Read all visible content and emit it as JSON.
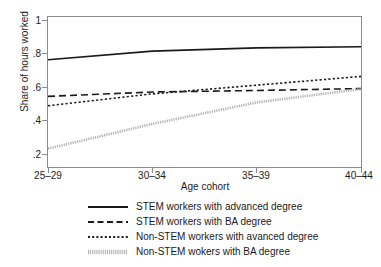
{
  "chart_data": {
    "type": "line",
    "title": "",
    "xlabel": "Age cohort",
    "ylabel": "Share of hours worked",
    "categories": [
      "25–29",
      "30–34",
      "35–39",
      "40–44"
    ],
    "x": [
      0,
      1,
      2,
      3
    ],
    "xlim": [
      0,
      3
    ],
    "ylim": [
      0.2,
      1
    ],
    "yticks": [
      "1",
      ".8",
      ".6",
      ".4",
      ".2"
    ],
    "ytick_values": [
      1,
      0.8,
      0.6,
      0.4,
      0.2
    ],
    "grid": false,
    "legend_position": "below",
    "series": [
      {
        "name": "STEM workers with advanced degree",
        "style": "solid",
        "color": "#1a1a1a",
        "values": [
          0.77,
          0.815,
          0.832,
          0.838
        ]
      },
      {
        "name": "STEM workers with BA degree",
        "style": "dashed",
        "color": "#1a1a1a",
        "values": [
          0.577,
          0.6,
          0.608,
          0.618
        ]
      },
      {
        "name": "Non-STEM workers with avanced degree",
        "style": "dotted",
        "color": "#1a1a1a",
        "values": [
          0.528,
          0.59,
          0.636,
          0.682
        ]
      },
      {
        "name": "Non-STEM wokers with BA degree",
        "style": "dense-dotted-light",
        "color": "#b0b0b0",
        "values": [
          0.302,
          0.432,
          0.545,
          0.616
        ]
      }
    ]
  },
  "axis": {
    "y_title": "Share of hours worked",
    "x_title": "Age cohort",
    "y_ticks": [
      "1",
      ".8",
      ".6",
      ".4",
      ".2"
    ],
    "x_ticks": [
      "25–29",
      "30–34",
      "35–39",
      "40–44"
    ]
  },
  "legend": {
    "items": [
      {
        "label": "STEM workers with advanced degree",
        "style": "solid"
      },
      {
        "label": "STEM workers with BA degree",
        "style": "dashed"
      },
      {
        "label": "Non-STEM workers with avanced degree",
        "style": "dotted"
      },
      {
        "label": "Non-STEM wokers with BA degree",
        "style": "dense-dotted-light"
      }
    ]
  },
  "colors": {
    "line": "#1a1a1a",
    "light_line": "#b0b0b0",
    "frame": "#8c8c8c",
    "background": "#ffffff"
  }
}
